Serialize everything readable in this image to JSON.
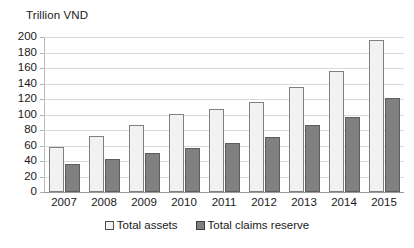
{
  "chart_data": {
    "type": "bar",
    "title": "",
    "subtitle": "",
    "xlabel": "",
    "ylabel": "Trillion VND",
    "ylim": [
      0,
      200
    ],
    "ytick_step": 20,
    "yticks": [
      200,
      180,
      160,
      140,
      120,
      100,
      80,
      60,
      40,
      20,
      0
    ],
    "categories": [
      "2007",
      "2008",
      "2009",
      "2010",
      "2011",
      "2012",
      "2013",
      "2014",
      "2015"
    ],
    "grid": true,
    "legend_position": "bottom",
    "series": [
      {
        "name": "Total assets",
        "color": "#F2F2F2",
        "border_color": "#808080",
        "values": [
          58,
          72,
          86,
          101,
          107,
          116,
          136,
          156,
          196
        ]
      },
      {
        "name": "Total claims reserve",
        "color": "#808080",
        "border_color": "#5E5E5E",
        "values": [
          36,
          43,
          50,
          57,
          63,
          71,
          86,
          97,
          121
        ]
      }
    ],
    "annotations": []
  },
  "axis": {
    "y_title": "Trillion VND"
  },
  "legend": {
    "items": [
      {
        "label": "Total assets"
      },
      {
        "label": "Total claims reserve"
      }
    ]
  }
}
